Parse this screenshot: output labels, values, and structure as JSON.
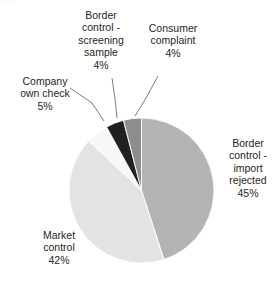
{
  "corner_mark": "(%)",
  "chart_data": {
    "type": "pie",
    "title": "",
    "subtitle": "",
    "xlabel": "",
    "ylabel": "",
    "legend_position": "labels-outside",
    "grid": false,
    "unit": "%",
    "total": 100,
    "categories": [
      "Border control - import rejected",
      "Market control",
      "Company own check",
      "Border control - screening sample",
      "Consumer complaint"
    ],
    "values": [
      45,
      42,
      5,
      4,
      4
    ],
    "colors": [
      "#b3b3b3",
      "#e3e3e3",
      "#f7f7f7",
      "#211f1f",
      "#8e8e8e"
    ],
    "slices": [
      {
        "label_lines": [
          "Border",
          "control -",
          "import",
          "rejected"
        ],
        "label_text": "Border control - import rejected",
        "value": 45,
        "value_text": "45%",
        "color": "#b3b3b3",
        "start_angle": 0,
        "end_angle": 162,
        "leader": false
      },
      {
        "label_lines": [
          "Market",
          "control"
        ],
        "label_text": "Market control",
        "value": 42,
        "value_text": "42%",
        "color": "#e3e3e3",
        "start_angle": 162,
        "end_angle": 313.2,
        "leader": false
      },
      {
        "label_lines": [
          "Company",
          "own check"
        ],
        "label_text": "Company own check",
        "value": 5,
        "value_text": "5%",
        "color": "#f7f7f7",
        "start_angle": 313.2,
        "end_angle": 331.2,
        "leader": true
      },
      {
        "label_lines": [
          "Border",
          "control -",
          "screening",
          "sample"
        ],
        "label_text": "Border control - screening sample",
        "value": 4,
        "value_text": "4%",
        "color": "#211f1f",
        "start_angle": 331.2,
        "end_angle": 345.6,
        "leader": true
      },
      {
        "label_lines": [
          "Consumer",
          "complaint"
        ],
        "label_text": "Consumer complaint",
        "value": 4,
        "value_text": "4%",
        "color": "#8e8e8e",
        "start_angle": 345.6,
        "end_angle": 360,
        "leader": true
      }
    ]
  },
  "labels": {
    "screening": {
      "l1": "Border",
      "l2": "control -",
      "l3": "screening",
      "l4": "sample",
      "pct": "4%"
    },
    "consumer": {
      "l1": "Consumer",
      "l2": "complaint",
      "pct": "4%"
    },
    "company": {
      "l1": "Company",
      "l2": "own check",
      "pct": "5%"
    },
    "import": {
      "l1": "Border",
      "l2": "control -",
      "l3": "import",
      "l4": "rejected",
      "pct": "45%"
    },
    "market": {
      "l1": "Market",
      "l2": "control",
      "pct": "42%"
    }
  }
}
